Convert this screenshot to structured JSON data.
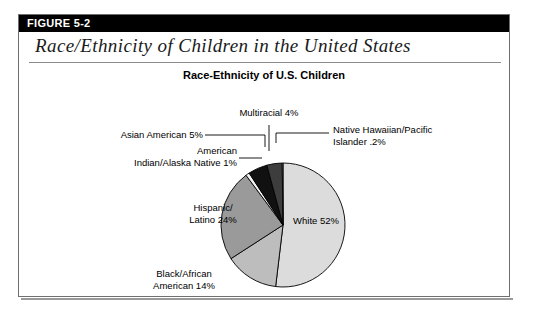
{
  "figure": {
    "number_label": "FIGURE 5-2",
    "script_title": "Race/Ethnicity of Children in the United States"
  },
  "chart_data": {
    "type": "pie",
    "title": "Race-Ethnicity of U.S. Children",
    "xlabel": "",
    "ylabel": "",
    "legend_position": "none",
    "grid": false,
    "categories": [
      "White",
      "Black/African American",
      "Hispanic/Latino",
      "American Indian/Alaska Native",
      "Asian American",
      "Multiracial",
      "Native Hawaiian/Pacific Islander"
    ],
    "values": [
      52,
      14,
      24,
      1,
      5,
      4,
      0.2
    ],
    "value_labels": [
      "52%",
      "14%",
      "24%",
      "1%",
      "5%",
      "4%",
      ".2%"
    ],
    "colors": [
      "#dcdcdc",
      "#bdbdbd",
      "#9a9a9a",
      "#f2f2f2",
      "#111111",
      "#3d3d3d",
      "#ffffff"
    ],
    "slices": [
      {
        "name": "White",
        "value": 52,
        "label": "White 52%",
        "color": "#dcdcdc",
        "label_style": "inside"
      },
      {
        "name": "Black/African American",
        "value": 14,
        "label_line1": "Black/African",
        "label_line2": "American 14%",
        "color": "#bdbdbd",
        "label_style": "outside"
      },
      {
        "name": "Hispanic/Latino",
        "value": 24,
        "label_line1": "Hispanic/",
        "label_line2": "Latino 24%",
        "color": "#9a9a9a",
        "label_style": "inside"
      },
      {
        "name": "American Indian/Alaska Native",
        "value": 1,
        "label_line1": "American",
        "label_line2": "Indian/Alaska Native 1%",
        "color": "#f2f2f2",
        "label_style": "leader"
      },
      {
        "name": "Asian American",
        "value": 5,
        "label": "Asian American 5%",
        "color": "#111111",
        "label_style": "leader"
      },
      {
        "name": "Multiracial",
        "value": 4,
        "label": "Multiracial 4%",
        "color": "#3d3d3d",
        "label_style": "leader"
      },
      {
        "name": "Native Hawaiian/Pacific Islander",
        "value": 0.2,
        "label_line1": "Native Hawaiian/Pacific",
        "label_line2": "Islander .2%",
        "color": "#ffffff",
        "label_style": "leader"
      }
    ]
  }
}
